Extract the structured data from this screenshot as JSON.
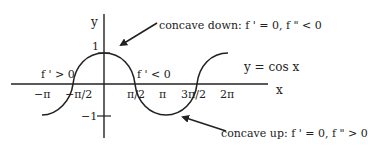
{
  "diagram": {
    "function_label": "y = cos x",
    "axes": {
      "x_label": "x",
      "y_label": "y",
      "x_ticks": [
        "−π",
        "−π/2",
        "π/2",
        "π",
        "3π/2",
        "2π"
      ],
      "y_ticks": [
        "1",
        "−1"
      ]
    },
    "annotations": {
      "concave_down": "concave down: f ' = 0, f \" < 0",
      "concave_up": "concave up: f ' = 0, f \" > 0",
      "increasing": "f ' > 0",
      "decreasing": "f ' < 0"
    },
    "colors": {
      "line": "#222222",
      "background": "#ffffff"
    }
  }
}
